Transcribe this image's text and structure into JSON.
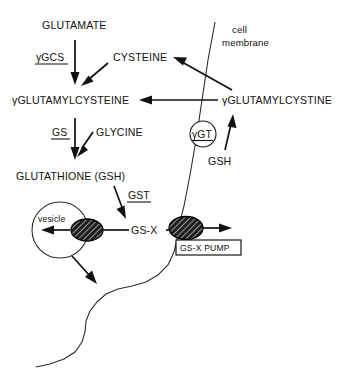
{
  "diagram": {
    "background_color": "#ffffff",
    "line_color": "#111111",
    "metabolites": {
      "glutamate": "GLUTAMATE",
      "cysteine": "CYSTEINE",
      "glutamylcysteine": "γGLUTAMYLCYSTEINE",
      "glutamylcystine": "γGLUTAMYLCYSTINE",
      "glycine": "GLYCINE",
      "glutathione": "GLUTATHIONE (GSH)",
      "gsh_extracellular": "GSH",
      "gs_x": "GS-X"
    },
    "enzymes": {
      "gamma_gcs": "γGCS",
      "gs": "GS",
      "gst": "GST",
      "gamma_gt": "γGT"
    },
    "structures": {
      "cell_membrane_line1": "cell",
      "cell_membrane_line2": "membrane",
      "vesicle": "vesicle",
      "gs_x_pump": "GS-X PUMP"
    }
  }
}
